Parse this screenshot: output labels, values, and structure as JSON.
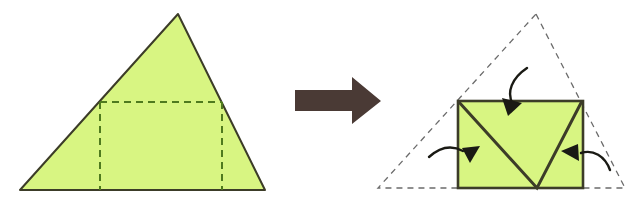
{
  "figure": {
    "caption": "",
    "width": 638,
    "height": 212,
    "background_color": "#ffffff"
  },
  "colors": {
    "paper_fill": "#d8f582",
    "solid_edge": "#3c3c28",
    "dashed_fold_line_left": "#4f7a1e",
    "dashed_ghost_line_right": "#6b6b6b",
    "arrow_block": "#4a3a35",
    "curved_arrow": "#1a1a14"
  },
  "left_panel": {
    "label": "before-fold-triangle",
    "shape": "triangle",
    "triangle_points": "178,14 265,190 20,190",
    "fold_lines": {
      "horizontal_label": "horizontal-fold-crease",
      "horizontal": "100,102 222,102",
      "left_vertical_label": "left-vertical-fold-crease",
      "left_vertical": "100,102 100,190",
      "right_vertical_label": "right-vertical-fold-crease",
      "right_vertical": "222,102 222,190"
    },
    "dash_pattern": "7 5",
    "stroke_width": 2
  },
  "transition_arrow": {
    "label": "transition-arrow-right",
    "points": "295,90 352,90 352,77 381,101 352,124 352,111 295,111",
    "direction": "right"
  },
  "right_panel": {
    "label": "after-fold-rectangle",
    "ghost_triangle": {
      "label": "ghost-triangle-outline",
      "points": "536,14 625,188 378,188",
      "dash_pattern": "6 5",
      "stroke_width": 1.3
    },
    "rectangle": {
      "label": "folded-rectangle",
      "x": 458,
      "y": 101,
      "width": 125,
      "height": 87,
      "stroke_width": 2.6
    },
    "v_crease": {
      "label": "v-shaped-crease",
      "points": "458,101 537,188 582,101",
      "stroke_width": 3
    },
    "curved_arrows": [
      {
        "label": "fold-arrow-top",
        "path": "M 527,68 C 512,78 506,92 513,105",
        "head": "508,116 503,99 521,104"
      },
      {
        "label": "fold-arrow-left",
        "path": "M 429,157 C 440,147 453,146 464,152",
        "head": "479,159 461,160 467,144"
      },
      {
        "label": "fold-arrow-right",
        "path": "M 610,170 C 604,156 592,150 580,153",
        "head": "562,153 579,146 577,163"
      }
    ]
  }
}
